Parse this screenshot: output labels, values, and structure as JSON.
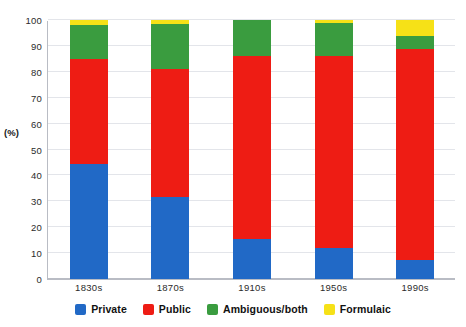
{
  "chart_data": {
    "type": "bar",
    "stacked": true,
    "title": "",
    "subtitle": "",
    "xlabel": "",
    "ylabel": "(%)",
    "categories": [
      "1830s",
      "1870s",
      "1910s",
      "1950s",
      "1990s"
    ],
    "series": [
      {
        "name": "Private",
        "color": "#2169C6",
        "values": [
          44.5,
          31.5,
          15.5,
          12.0,
          7.5
        ]
      },
      {
        "name": "Public",
        "color": "#EE1C14",
        "values": [
          40.5,
          49.5,
          70.5,
          74.0,
          81.5
        ]
      },
      {
        "name": "Ambiguous/both",
        "color": "#3A9C3F",
        "values": [
          13.0,
          17.5,
          14.0,
          13.0,
          5.0
        ]
      },
      {
        "name": "Formulaic",
        "color": "#F6E117",
        "values": [
          2.0,
          1.5,
          0.0,
          1.0,
          6.0
        ]
      }
    ],
    "cumulative_tops": {
      "1830s": [
        44.5,
        85.0,
        98.0,
        100.0
      ],
      "1870s": [
        31.5,
        81.0,
        98.5,
        100.0
      ],
      "1910s": [
        15.5,
        86.0,
        100.0,
        100.0
      ],
      "1950s": [
        12.0,
        86.0,
        99.0,
        100.0
      ],
      "1990s": [
        7.5,
        89.0,
        94.0,
        100.0
      ]
    },
    "yticks": [
      0,
      10,
      20,
      30,
      40,
      50,
      60,
      70,
      80,
      90,
      100
    ],
    "ytick_labels": [
      "0",
      "10",
      "20",
      "30",
      "40",
      "50",
      "60",
      "70",
      "80",
      "90",
      "100"
    ],
    "ylim": [
      0,
      100
    ],
    "grid": true,
    "legend_position": "bottom",
    "legend": [
      {
        "label": "Private",
        "color": "#2169C6"
      },
      {
        "label": "Public",
        "color": "#EE1C14"
      },
      {
        "label": "Ambiguous/both",
        "color": "#3A9C3F"
      },
      {
        "label": "Formulaic",
        "color": "#F6E117"
      }
    ],
    "colors": {
      "private": "#2169C6",
      "public": "#EE1C14",
      "ambiguous": "#3A9C3F",
      "formulaic": "#F6E117",
      "grid": "#E3E5EA",
      "axis": "#B9BCC4",
      "text": "#2B2B2B",
      "background": "#FFFFFF"
    }
  }
}
